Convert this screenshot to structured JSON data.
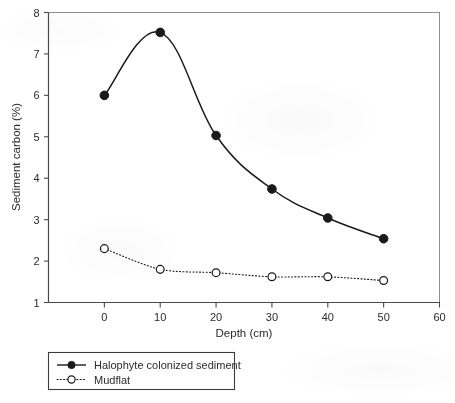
{
  "chart_data": {
    "type": "line",
    "title": "",
    "xlabel": "Depth (cm)",
    "ylabel": "Sediment carbon (%)",
    "xlim": [
      -10,
      60
    ],
    "ylim": [
      1,
      8
    ],
    "xticks": [
      0,
      10,
      20,
      30,
      40,
      50,
      60
    ],
    "xticklabels": [
      "0",
      "10",
      "20",
      "30",
      "40",
      "50",
      "60"
    ],
    "yticks": [
      1,
      2,
      3,
      4,
      5,
      6,
      7,
      8
    ],
    "yticklabels": [
      "1",
      "2",
      "3",
      "4",
      "5",
      "6",
      "7",
      "8"
    ],
    "grid": false,
    "legend_position": "below-left",
    "x": [
      0,
      10,
      20,
      30,
      40,
      50
    ],
    "series": [
      {
        "name": "Halophyte colonized sediment",
        "values": [
          6.0,
          7.52,
          5.03,
          3.74,
          3.04,
          2.54
        ],
        "line_style": "solid",
        "marker": "filled-circle",
        "color": "#1a1a1a"
      },
      {
        "name": "Mudflat",
        "values": [
          2.3,
          1.8,
          1.72,
          1.62,
          1.62,
          1.53
        ],
        "line_style": "dotted",
        "marker": "open-circle",
        "color": "#1a1a1a"
      }
    ]
  },
  "axis": {
    "x_title": "Depth (cm)",
    "y_title": "Sediment carbon (%)"
  },
  "legend": {
    "entries": [
      {
        "label": "Halophyte colonized sediment"
      },
      {
        "label": "Mudflat"
      }
    ]
  },
  "caption": {
    "text": ""
  },
  "colors": {
    "ink": "#1a1a1a",
    "axis": "#4a4a4a",
    "paper": "#ffffff"
  }
}
